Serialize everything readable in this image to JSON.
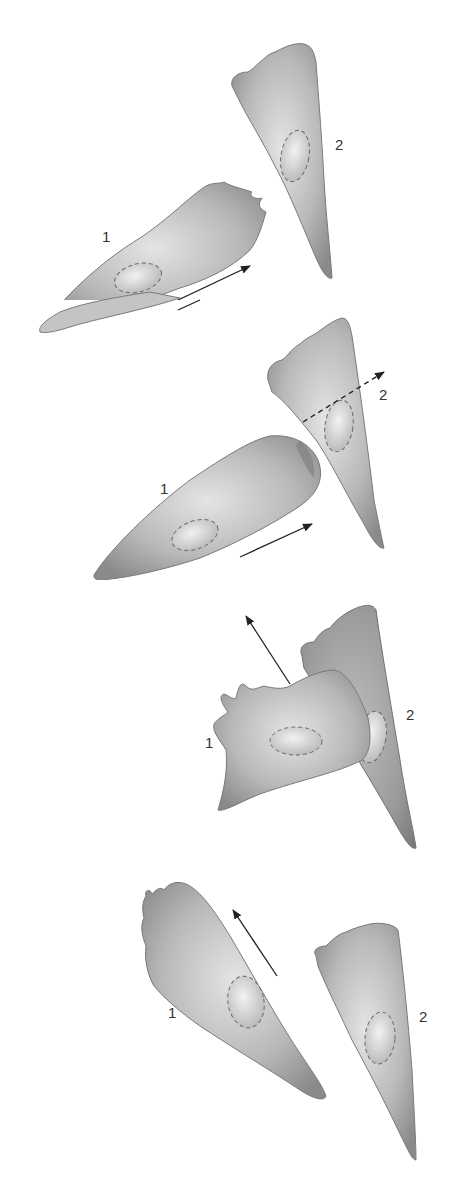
{
  "figure": {
    "colors": {
      "cell_fill_light": "#d6d6d6",
      "cell_fill_dark": "#8e8e8e",
      "cell_outline": "#7a7a7a",
      "nucleus_outline": "#6a6a6a",
      "arrow": "#222222",
      "label": "#333333"
    },
    "panels": [
      {
        "step": 1,
        "state": "Cell 1 migrates toward cell 2",
        "cell1_label": "1",
        "cell2_label": "2",
        "arrow": "solid arrow pointing up-right (cell 1 direction of motion)"
      },
      {
        "step": 2,
        "state": "Cell 1 leading edge contacts cell 2",
        "cell1_label": "1",
        "cell2_label": "2",
        "arrow": "solid arrow up-right under cell 1; dashed arrow across cell 2"
      },
      {
        "step": 3,
        "state": "Cell 1 leading edge ruffles and retracts; new protrusion forms",
        "cell1_label": "1",
        "cell2_label": "2",
        "arrow": "solid arrow pointing up-left (new direction)"
      },
      {
        "step": 4,
        "state": "Cell 1 moves away in a new direction",
        "cell1_label": "1",
        "cell2_label": "2",
        "arrow": "solid arrow pointing up-left"
      }
    ]
  }
}
